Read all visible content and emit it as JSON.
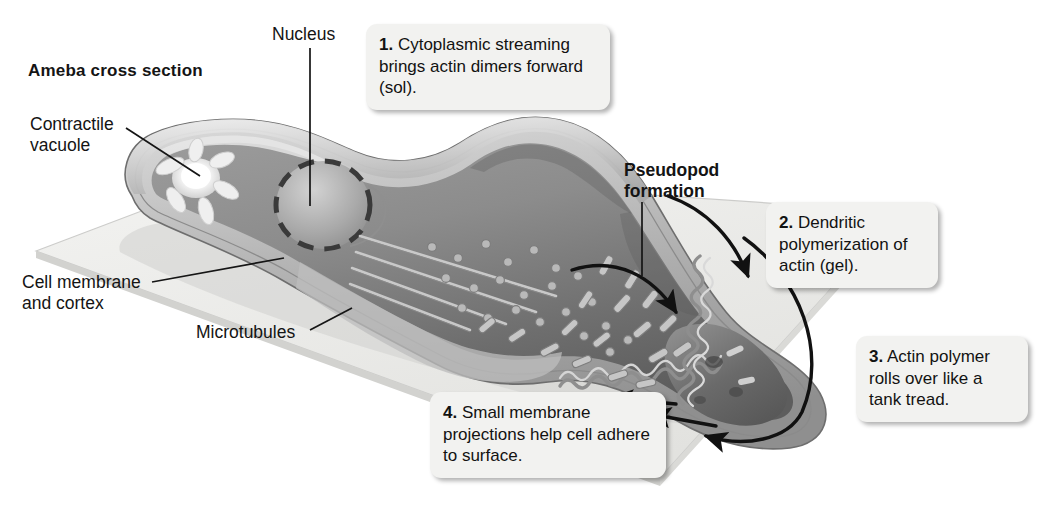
{
  "figure": {
    "title": "Ameba cross section"
  },
  "labels": {
    "nucleus": "Nucleus",
    "contractile_vacuole": "Contractile\nvacuole",
    "cell_membrane": "Cell membrane\nand cortex",
    "microtubules": "Microtubules",
    "pseudopod": "Pseudopod\nformation"
  },
  "callouts": [
    {
      "number": "1.",
      "text": " Cytoplasmic streaming brings actin dimers forward (sol)."
    },
    {
      "number": "2.",
      "text": " Dendritic polymerization of actin (gel)."
    },
    {
      "number": "3.",
      "text": " Actin polymer rolls over like a tank tread."
    },
    {
      "number": "4.",
      "text": " Small membrane projections help cell adhere to surface."
    }
  ],
  "colors": {
    "background": "#ffffff",
    "callout_fill": "#f2f2f0",
    "text": "#121212",
    "substrate": "#e9e9e7",
    "substrate_edge": "#c9c9c6",
    "cytoplasm_light": "#cfcfcf",
    "cytoplasm_mid": "#a8a8a8",
    "cytoplasm_dark": "#7d7d7d",
    "cortex": "#bdbdbd",
    "membrane_line": "#6f6f6f",
    "nucleus_fill": "#b4b4b4",
    "nucleus_dash": "#3c3c3c",
    "vacuole": "#fbfbfb",
    "leader_line": "#1a1a1a",
    "arrow": "#111111"
  }
}
